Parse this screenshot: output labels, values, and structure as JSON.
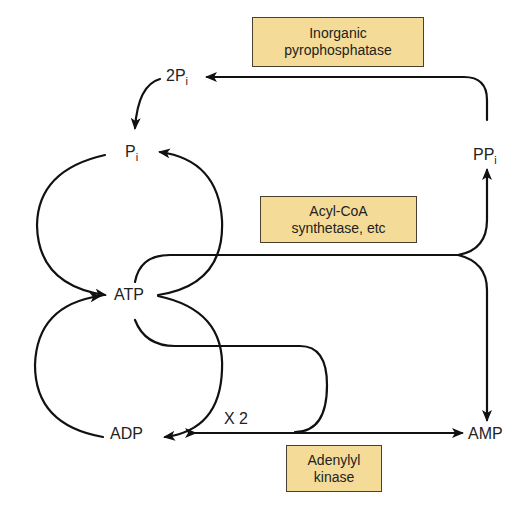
{
  "enzymes": {
    "pyrophosphatase": {
      "line1": "Inorganic",
      "line2": "pyrophosphatase"
    },
    "acyl_coa": {
      "line1": "Acyl-CoA",
      "line2": "synthetase, etc"
    },
    "adenylyl_kinase": {
      "line1": "Adenylyl",
      "line2": "kinase"
    }
  },
  "metabolites": {
    "two_pi": {
      "base": "2P",
      "sub": "i"
    },
    "pi": {
      "base": "P",
      "sub": "i"
    },
    "ppi": {
      "base": "PP",
      "sub": "i"
    },
    "atp": "ATP",
    "adp": "ADP",
    "amp": "AMP"
  },
  "annotations": {
    "times_two": "X 2"
  },
  "colors": {
    "box_fill": "#f4dc98",
    "box_border": "#4a4030",
    "line": "#111111"
  }
}
